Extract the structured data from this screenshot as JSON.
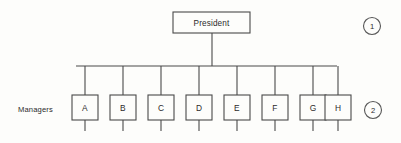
{
  "diagram": {
    "type": "organization-chart",
    "background_color": "#fdfdfb",
    "line_color": "#4a4a4a",
    "text_color": "#2b2b2b",
    "root": {
      "label": "President",
      "box": {
        "x": 173,
        "y": 12,
        "width": 77,
        "height": 21
      }
    },
    "row_labels": [
      {
        "text": "Managers",
        "x": 18,
        "y": 110
      }
    ],
    "children": [
      {
        "label": "A",
        "box": {
          "x": 72,
          "y": 95,
          "width": 26,
          "height": 25
        }
      },
      {
        "label": "B",
        "box": {
          "x": 110,
          "y": 95,
          "width": 26,
          "height": 25
        }
      },
      {
        "label": "C",
        "box": {
          "x": 148,
          "y": 95,
          "width": 26,
          "height": 25
        }
      },
      {
        "label": "D",
        "box": {
          "x": 186,
          "y": 95,
          "width": 26,
          "height": 25
        }
      },
      {
        "label": "E",
        "box": {
          "x": 224,
          "y": 95,
          "width": 26,
          "height": 25
        }
      },
      {
        "label": "F",
        "box": {
          "x": 262,
          "y": 95,
          "width": 26,
          "height": 25
        }
      },
      {
        "label": "G",
        "box": {
          "x": 300,
          "y": 95,
          "width": 26,
          "height": 25
        }
      },
      {
        "label": "H",
        "box": {
          "x": 325,
          "y": 95,
          "width": 26,
          "height": 25
        }
      }
    ],
    "bus": {
      "y": 66,
      "x_start": 76,
      "x_end": 337
    },
    "root_stem": {
      "x": 212,
      "y_start": 33,
      "y_end": 66
    },
    "stub_length": 11,
    "markers": [
      {
        "label": "1",
        "cx": 372,
        "cy": 26,
        "r": 8.5
      },
      {
        "label": "2",
        "cx": 373,
        "cy": 110,
        "r": 8.5
      }
    ]
  }
}
